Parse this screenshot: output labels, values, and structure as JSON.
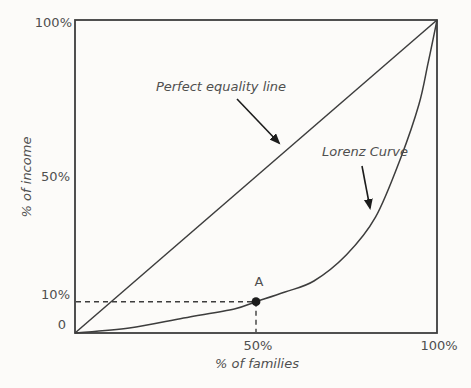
{
  "colors": {
    "line": "#3d3d3d",
    "text": "#4f4f4f",
    "marker": "#1c1c1c",
    "background": "#fcfbf9"
  },
  "chart_data": {
    "type": "line",
    "title": "",
    "xlabel": "% of families",
    "ylabel": "% of income",
    "xlim": [
      0,
      100
    ],
    "ylim": [
      0,
      100
    ],
    "grid": false,
    "legend_position": "none",
    "axes": {
      "y_ticks": [
        {
          "value": 100,
          "label": "100%"
        },
        {
          "value": 50,
          "label": "50%"
        },
        {
          "value": 10,
          "label": "10%"
        },
        {
          "value": 0,
          "label": "0"
        }
      ],
      "x_ticks": [
        {
          "value": 50,
          "label": "50%"
        },
        {
          "value": 100,
          "label": "100%"
        }
      ]
    },
    "series": [
      {
        "name": "Perfect equality line",
        "shape": "straight",
        "points": [
          [
            0,
            0
          ],
          [
            100,
            100
          ]
        ]
      },
      {
        "name": "Lorenz Curve",
        "shape": "smooth",
        "points": [
          [
            0,
            0
          ],
          [
            15,
            1.6
          ],
          [
            30,
            4.8
          ],
          [
            44,
            7.7
          ],
          [
            50,
            10
          ],
          [
            58,
            13.1
          ],
          [
            66,
            16.6
          ],
          [
            75,
            25
          ],
          [
            83,
            37
          ],
          [
            90,
            56
          ],
          [
            95,
            73
          ],
          [
            97.5,
            86
          ],
          [
            100,
            100
          ]
        ]
      }
    ],
    "marked_point": {
      "label": "A",
      "x": 50,
      "y": 10,
      "guides": "dashed-to-both-axes"
    },
    "annotations": {
      "equality": {
        "text": "Perfect equality line",
        "arrow": true
      },
      "lorenz": {
        "text": "Lorenz Curve",
        "arrow": true
      }
    }
  }
}
